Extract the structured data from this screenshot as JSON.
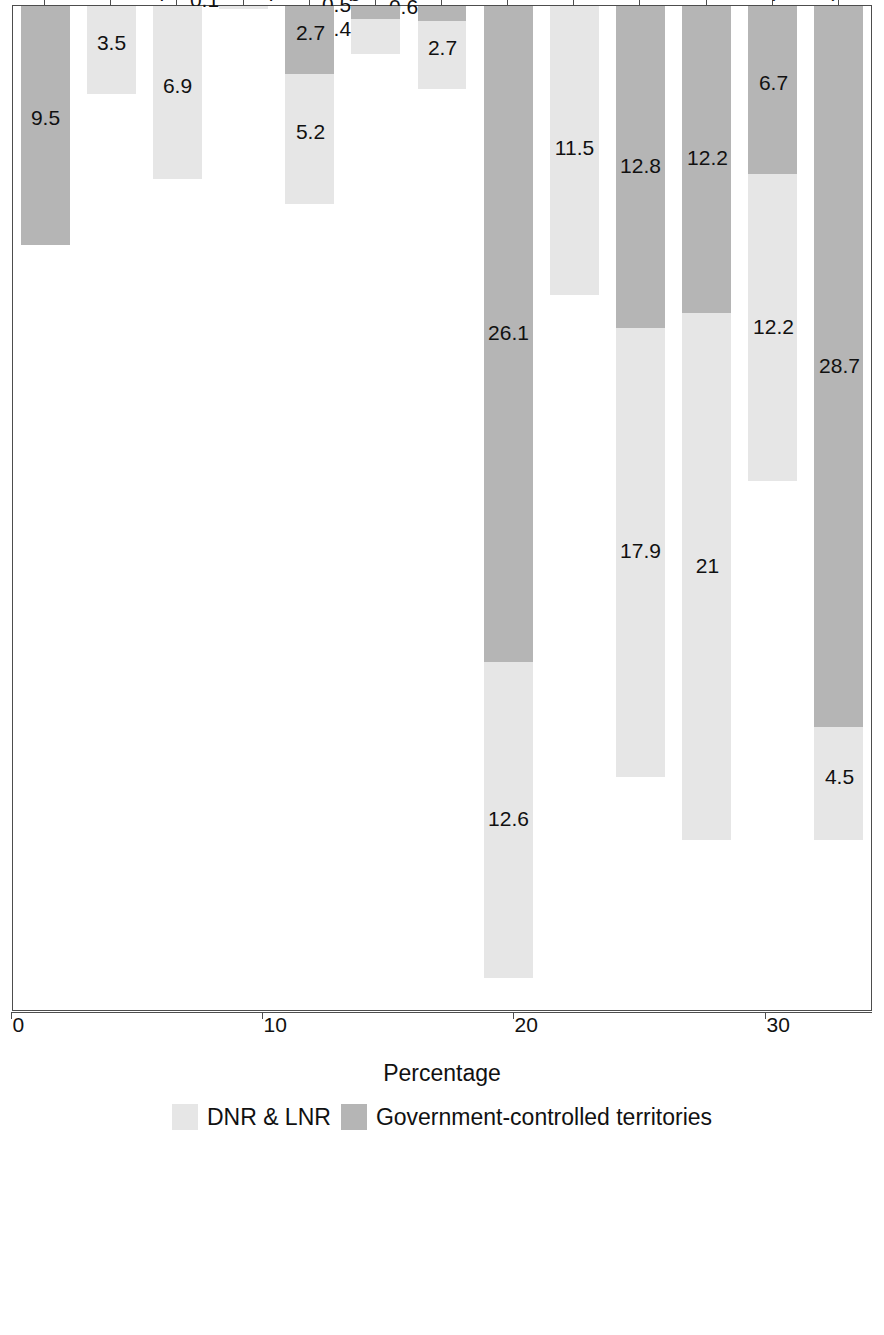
{
  "chart_data": {
    "type": "bar",
    "orientation": "horizontal-stacked",
    "title": "",
    "xlabel": "Percentage",
    "ylabel": "",
    "xlim": [
      0,
      40
    ],
    "xticks": [
      0,
      10,
      20,
      30,
      40
    ],
    "grid": false,
    "legend_position": "bottom",
    "stacked": true,
    "colors": {
      "dnr_lnr": "#e6e6e6",
      "government_controlled": "#b5b5b5",
      "axis": "#4d4d4d",
      "text": "#111111",
      "background": "#ffffff"
    },
    "categories": [
      "Ethnic Ukrainian",
      "Ethnic Russian",
      "Mixed (ethnic) Ukrainian & Russian",
      "Donbas resident",
      "DNR or LNR resident",
      "Ukrainian citizen",
      "Russian citizen",
      "Dual Ukrainian–Russian citizen",
      "Bilingual Ukrainian-Russian",
      "Ukrainian speaker",
      "Russian speaker",
      "Occupation or social class",
      "Other"
    ],
    "series": [
      {
        "name": "Government-controlled territories",
        "color": "#b5b5b5",
        "values": [
          28.7,
          6.7,
          12.2,
          12.8,
          0,
          26.1,
          0.6,
          0.5,
          2.7,
          0,
          0,
          0,
          9.5
        ],
        "labels": [
          "28.7",
          "6.7",
          "12.2",
          "12.8",
          "",
          "26.1",
          "0.6",
          "0.5",
          "2.7",
          "",
          "",
          "",
          "9.5"
        ]
      },
      {
        "name": "DNR & LNR",
        "color": "#e6e6e6",
        "values": [
          4.5,
          12.2,
          21,
          17.9,
          11.5,
          12.6,
          2.7,
          1.4,
          5.2,
          0.1,
          6.9,
          3.5,
          0
        ],
        "labels": [
          "4.5",
          "12.2",
          "21",
          "17.9",
          "11.5",
          "12.6",
          "2.7",
          "1.4",
          "5.2",
          "0.1",
          "6.9",
          "3.5",
          ""
        ]
      }
    ],
    "totals": [
      33.2,
      18.9,
      33.2,
      30.7,
      11.5,
      38.7,
      3.3,
      1.9,
      7.9,
      0.1,
      6.9,
      3.5,
      9.5
    ]
  },
  "legend": {
    "items": [
      {
        "label": "DNR & LNR",
        "swatch": "light"
      },
      {
        "label": "Government-controlled territories",
        "swatch": "dark"
      }
    ]
  },
  "axis": {
    "value_axis_title": "Percentage",
    "tick_labels": [
      "0",
      "10",
      "20",
      "30",
      "40"
    ]
  }
}
